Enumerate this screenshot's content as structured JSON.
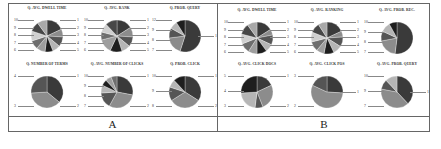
{
  "panels": [
    {
      "label": "A",
      "charts": [
        {
          "title": "Q. AVG. DWELL TIME",
          "slices": [
            18,
            8,
            10,
            8,
            8,
            9,
            9,
            10,
            10,
            10
          ],
          "labels_left": [
            "10",
            "9",
            "8",
            "7",
            "6"
          ],
          "labels_right": [
            "1",
            "2",
            "3",
            "4",
            "5"
          ]
        },
        {
          "title": "Q. AVG. RANK",
          "slices": [
            16,
            10,
            10,
            9,
            12,
            14,
            8,
            9,
            12
          ],
          "labels_left": [
            "10",
            "9",
            "8",
            "7",
            "6"
          ],
          "labels_right": [
            "1",
            "2",
            "3",
            "4",
            "5"
          ]
        },
        {
          "title": "Q. PROB. QUERY",
          "slices": [
            55,
            18,
            10,
            8,
            9
          ],
          "labels_left": [
            "12",
            "9",
            "8",
            "7"
          ],
          "labels_right": [
            "1"
          ]
        },
        {
          "title": "Q. NUMBER OF TERMS",
          "slices": [
            36,
            38,
            26
          ],
          "labels_left": [
            "4",
            "3"
          ],
          "labels_right": [
            "1",
            "2"
          ]
        },
        {
          "title": "Q. AVG. NUMBER OF CLICKS",
          "slices": [
            28,
            30,
            16,
            8,
            6,
            6,
            6
          ],
          "labels_left": [
            "10",
            "9",
            "8",
            "7"
          ],
          "labels_right": [
            "1",
            "2"
          ]
        },
        {
          "title": "Q. PROB. CLICK",
          "slices": [
            34,
            32,
            14,
            8,
            12
          ],
          "labels_left": [
            "10",
            "9",
            "8"
          ],
          "labels_right": [
            "1",
            "2"
          ]
        }
      ]
    },
    {
      "label": "B",
      "charts": [
        {
          "title": "Q. AVG. DWELL TIME",
          "slices": [
            16,
            6,
            10,
            8,
            10,
            9,
            10,
            10,
            11,
            10
          ],
          "labels_left": [
            "10",
            "9",
            "8",
            "7",
            "6"
          ],
          "labels_right": [
            "1",
            "2",
            "3",
            "4",
            "5"
          ]
        },
        {
          "title": "Q. AVG. RANKING",
          "slices": [
            18,
            6,
            10,
            9,
            10,
            8,
            10,
            10,
            10,
            9
          ],
          "labels_left": [
            "10",
            "9",
            "8",
            "7",
            "6"
          ],
          "labels_right": [
            "1",
            "2",
            "3",
            "4",
            "5"
          ]
        },
        {
          "title": "Q. AVG. PROB. REC.",
          "slices": [
            52,
            20,
            10,
            10,
            8
          ],
          "labels_left": [
            "10",
            "9",
            "8",
            "7"
          ],
          "labels_right": []
        },
        {
          "title": "Q. AVG. CLICK DOCS",
          "slices": [
            18,
            26,
            8,
            22,
            26
          ],
          "labels_left": [
            "5",
            "4",
            "3"
          ],
          "labels_right": [
            "1",
            "2"
          ]
        },
        {
          "title": "Q. AVG. CLICK POS",
          "slices": [
            26,
            56,
            18
          ],
          "labels_left": [
            "3",
            "2"
          ],
          "labels_right": [
            "1"
          ]
        },
        {
          "title": "Q. AVG. PROB. QUERY",
          "slices": [
            38,
            40,
            10,
            12
          ],
          "labels_left": [
            "10",
            "9",
            "7"
          ],
          "labels_right": [
            "1"
          ]
        }
      ]
    }
  ],
  "colors": [
    "#3a3a3a",
    "#8c8c8c",
    "#555555",
    "#b5b5b5",
    "#1e1e1e",
    "#9e9e9e",
    "#6e6e6e",
    "#cfcfcf",
    "#474747",
    "#a8a8a8"
  ],
  "chart_data": [
    {
      "type": "pie",
      "title": "A: Q. AVG. DWELL TIME",
      "categories": [
        "1",
        "2",
        "3",
        "4",
        "5",
        "6",
        "7",
        "8",
        "9",
        "10"
      ],
      "values": [
        18,
        8,
        10,
        8,
        8,
        9,
        9,
        10,
        10,
        10
      ]
    },
    {
      "type": "pie",
      "title": "A: Q. AVG. RANK",
      "categories": [
        "1",
        "2",
        "3",
        "4",
        "5",
        "6",
        "7",
        "8",
        "9",
        "10"
      ],
      "values": [
        16,
        10,
        10,
        9,
        12,
        14,
        8,
        9,
        12
      ]
    },
    {
      "type": "pie",
      "title": "A: Q. PROB. QUERY",
      "categories": [
        "1",
        "7",
        "8",
        "9",
        "12"
      ],
      "values": [
        55,
        18,
        10,
        8,
        9
      ]
    },
    {
      "type": "pie",
      "title": "A: Q. NUMBER OF TERMS",
      "categories": [
        "1",
        "2",
        "3",
        "4"
      ],
      "values": [
        36,
        38,
        26
      ]
    },
    {
      "type": "pie",
      "title": "A: Q. AVG. NUMBER OF CLICKS",
      "categories": [
        "1",
        "2",
        "7",
        "8",
        "9",
        "10"
      ],
      "values": [
        28,
        30,
        16,
        8,
        6,
        6,
        6
      ]
    },
    {
      "type": "pie",
      "title": "A: Q. PROB. CLICK",
      "categories": [
        "1",
        "2",
        "8",
        "9",
        "10"
      ],
      "values": [
        34,
        32,
        14,
        8,
        12
      ]
    },
    {
      "type": "pie",
      "title": "B: Q. AVG. DWELL TIME",
      "categories": [
        "1",
        "2",
        "3",
        "4",
        "5",
        "6",
        "7",
        "8",
        "9",
        "10"
      ],
      "values": [
        16,
        6,
        10,
        8,
        10,
        9,
        10,
        10,
        11,
        10
      ]
    },
    {
      "type": "pie",
      "title": "B: Q. AVG. RANKING",
      "categories": [
        "1",
        "2",
        "3",
        "4",
        "5",
        "6",
        "7",
        "8",
        "9",
        "10"
      ],
      "values": [
        18,
        6,
        10,
        9,
        10,
        8,
        10,
        10,
        10,
        9
      ]
    },
    {
      "type": "pie",
      "title": "B: Q. AVG. PROB. REC.",
      "categories": [
        "1",
        "7",
        "8",
        "9",
        "10"
      ],
      "values": [
        52,
        20,
        10,
        10,
        8
      ]
    },
    {
      "type": "pie",
      "title": "B: Q. AVG. CLICK DOCS",
      "categories": [
        "1",
        "2",
        "3",
        "4",
        "5"
      ],
      "values": [
        18,
        26,
        8,
        22,
        26
      ]
    },
    {
      "type": "pie",
      "title": "B: Q. AVG. CLICK POS",
      "categories": [
        "1",
        "2",
        "3"
      ],
      "values": [
        26,
        56,
        18
      ]
    },
    {
      "type": "pie",
      "title": "B: Q. AVG. PROB. QUERY",
      "categories": [
        "1",
        "7",
        "9",
        "10"
      ],
      "values": [
        38,
        40,
        10,
        12
      ]
    }
  ]
}
